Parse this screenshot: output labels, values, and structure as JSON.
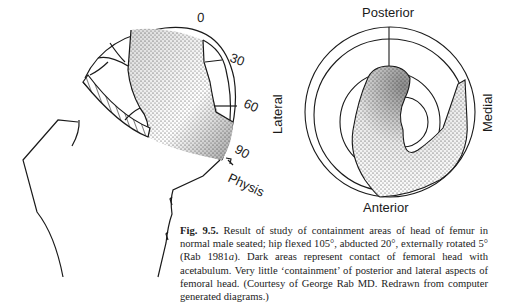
{
  "figure": {
    "left_diagram": {
      "description": "Lateral view of femoral head with containment area stippled",
      "angle_labels": [
        "0",
        "30",
        "60",
        "90"
      ],
      "physis_label": "Physis"
    },
    "right_diagram": {
      "description": "Polar projection of femoral head containment",
      "labels": {
        "top": "Posterior",
        "bottom": "Anterior",
        "left": "Lateral",
        "right": "Medial"
      }
    },
    "caption": {
      "fig_number": "Fig. 9.5.",
      "text_part1": " Result of study of containment areas of head of femur in normal male seated; hip flexed 105°, abducted 20°, externally rotated 5° (Rab 1981",
      "italic_ref": "a",
      "text_part2": "). Dark areas represent contact of femoral head with acetabulum. Very little ‘containment’ of posterior and lateral aspects of femoral head. (Courtesy of George Rab MD. Redrawn from computer generated diagrams.)"
    }
  }
}
